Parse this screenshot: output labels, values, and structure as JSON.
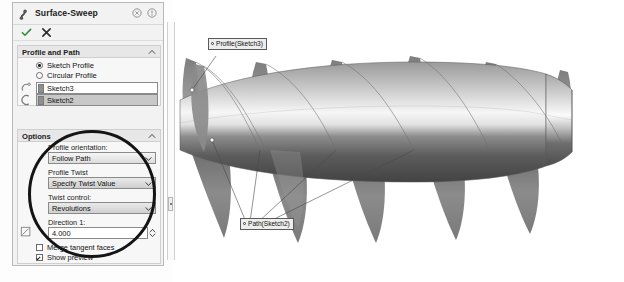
{
  "panel": {
    "title": "Surface-Sweep",
    "icons": {
      "sweep": "sweep-icon",
      "help_pin": "pin-icon",
      "help": "help-icon",
      "ok": "check-icon",
      "cancel": "close-icon"
    },
    "sections": [
      {
        "label": "Profile and Path",
        "collapse_icon": "chevron-up-icon"
      },
      {
        "label": "Options",
        "collapse_icon": "chevron-up-icon"
      }
    ],
    "profile_path": {
      "radios": [
        {
          "label": "Sketch Profile",
          "selected": true
        },
        {
          "label": "Circular Profile",
          "selected": false
        }
      ],
      "fields": [
        {
          "icon": "profile-select-icon",
          "value": "Sketch3",
          "selected": false
        },
        {
          "icon": "path-select-icon",
          "value": "Sketch2",
          "selected": true
        }
      ]
    },
    "options": {
      "profile_orientation": {
        "label": "Profile orientation:",
        "value": "Follow Path",
        "arrow": "chevron-down-icon"
      },
      "profile_twist": {
        "label": "Profile Twist",
        "value": "Specify Twist Value",
        "arrow": "chevron-down-icon"
      },
      "twist_control": {
        "label": "Twist control:",
        "value": "Revolutions",
        "arrow": "chevron-down-icon"
      },
      "direction1": {
        "label": "Direction 1:",
        "value": "4.000",
        "spinner": "spinner-icon"
      },
      "checkboxes": [
        {
          "label": "Merge tangent faces",
          "checked": false
        },
        {
          "label": "Show preview",
          "checked": true
        }
      ]
    }
  },
  "viewport": {
    "callouts": [
      {
        "name": "profile-callout",
        "text": "Profile(Sketch3)"
      },
      {
        "name": "path-callout",
        "text": "Path(Sketch2)"
      }
    ]
  },
  "colors": {
    "panel_bg": "#f2f2f2",
    "section_bg": "#e7e7e7",
    "selected_field": "#c8c8c8",
    "annotation": "#141414",
    "body_light": "#f4f4f4",
    "body_dark": "#4a4a4a",
    "fin": "#8e8e8e"
  }
}
